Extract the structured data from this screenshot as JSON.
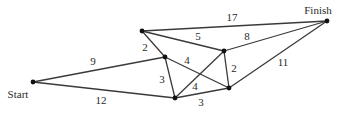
{
  "diagram": {
    "type": "weighted-graph",
    "nodes": [
      {
        "id": "start",
        "label": "Start",
        "x": 33,
        "y": 82,
        "lx": 18,
        "ly": 98
      },
      {
        "id": "a",
        "label": "",
        "x": 142,
        "y": 31
      },
      {
        "id": "b",
        "label": "",
        "x": 165,
        "y": 57
      },
      {
        "id": "c",
        "label": "",
        "x": 175,
        "y": 98
      },
      {
        "id": "d",
        "label": "",
        "x": 224,
        "y": 51
      },
      {
        "id": "e",
        "label": "",
        "x": 229,
        "y": 88
      },
      {
        "id": "finish",
        "label": "Finish",
        "x": 327,
        "y": 21,
        "lx": 318,
        "ly": 14
      }
    ],
    "edges": [
      {
        "from": "start",
        "to": "b",
        "weight": "9",
        "lx": 93,
        "ly": 65
      },
      {
        "from": "start",
        "to": "c",
        "weight": "12",
        "lx": 101,
        "ly": 104
      },
      {
        "from": "a",
        "to": "b",
        "weight": "2",
        "lx": 145,
        "ly": 51
      },
      {
        "from": "b",
        "to": "c",
        "weight": "3",
        "lx": 162,
        "ly": 83
      },
      {
        "from": "a",
        "to": "finish",
        "weight": "17",
        "lx": 232,
        "ly": 21
      },
      {
        "from": "a",
        "to": "d",
        "weight": "5",
        "lx": 198,
        "ly": 40
      },
      {
        "from": "d",
        "to": "finish",
        "weight": "8",
        "lx": 247,
        "ly": 40
      },
      {
        "from": "b",
        "to": "e",
        "weight": "4",
        "lx": 187,
        "ly": 64
      },
      {
        "from": "c",
        "to": "d",
        "weight": "4",
        "lx": 195,
        "ly": 90
      },
      {
        "from": "c",
        "to": "e",
        "weight": "3",
        "lx": 201,
        "ly": 106
      },
      {
        "from": "d",
        "to": "e",
        "weight": "2",
        "lx": 234,
        "ly": 72
      },
      {
        "from": "e",
        "to": "finish",
        "weight": "11",
        "lx": 283,
        "ly": 66
      }
    ]
  }
}
